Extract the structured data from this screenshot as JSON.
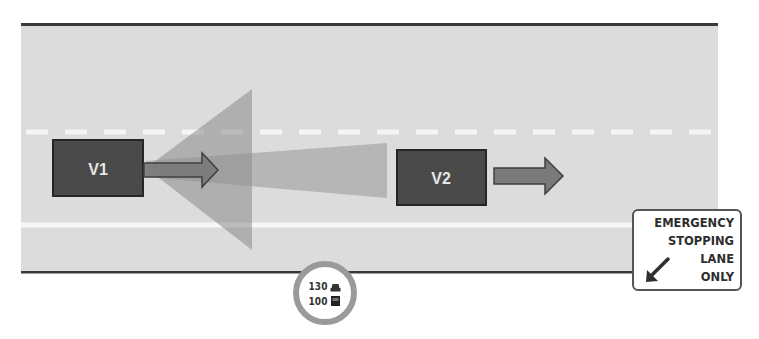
{
  "diagram": {
    "type": "road-scene"
  },
  "colors": {
    "road": "#dcdcdc",
    "road_border": "#3a3a3a",
    "lane_marking": "#f5f5f5",
    "vehicle_fill": "#4a4a4a",
    "vehicle_border": "#262626",
    "vehicle_label": "#e6e6e6",
    "sensor_cone": "#8a8a8a",
    "arrow_fill": "#7a7a7a",
    "sign_border": "#555555",
    "speed_ring": "#9a9a9a"
  },
  "vehicles": [
    {
      "id": "V1",
      "label": "V1",
      "direction": "right"
    },
    {
      "id": "V2",
      "label": "V2",
      "direction": "right"
    }
  ],
  "sensors": [
    {
      "owner": "V1",
      "kind": "wide-short-range"
    },
    {
      "owner": "V1",
      "kind": "narrow-long-range"
    }
  ],
  "speed_limit_sign": {
    "car_limit": "130",
    "truck_limit": "100",
    "car_icon": "car-icon",
    "truck_icon": "truck-icon"
  },
  "emergency_sign": {
    "lines": [
      "EMERGENCY",
      "STOPPING",
      "LANE",
      "ONLY"
    ],
    "arrow_icon": "arrow-down-left-icon"
  }
}
